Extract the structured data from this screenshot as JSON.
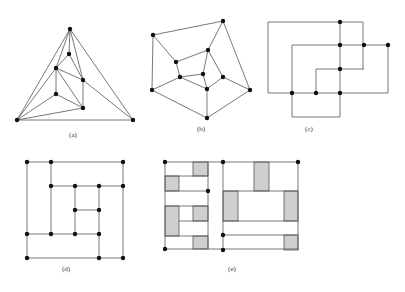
{
  "figure": {
    "panels": [
      {
        "id": "a",
        "label": "(a)",
        "label_pos": [
          73,
          137
        ],
        "nodes": [
          [
            70,
            29
          ],
          [
            69,
            54
          ],
          [
            56,
            68
          ],
          [
            83,
            80
          ],
          [
            56,
            94
          ],
          [
            83,
            108
          ],
          [
            17,
            120
          ],
          [
            133,
            120
          ]
        ],
        "edges": [
          [
            0,
            1
          ],
          [
            0,
            2
          ],
          [
            0,
            3
          ],
          [
            0,
            6
          ],
          [
            0,
            7
          ],
          [
            1,
            2
          ],
          [
            1,
            3
          ],
          [
            2,
            3
          ],
          [
            2,
            4
          ],
          [
            2,
            5
          ],
          [
            2,
            6
          ],
          [
            3,
            5
          ],
          [
            3,
            7
          ],
          [
            4,
            5
          ],
          [
            4,
            6
          ],
          [
            5,
            6
          ],
          [
            6,
            7
          ]
        ]
      },
      {
        "id": "b",
        "label": "(b)",
        "label_pos": [
          201,
          131
        ],
        "nodes": [
          [
            153,
            35
          ],
          [
            223,
            21
          ],
          [
            176,
            62
          ],
          [
            208,
            50
          ],
          [
            180,
            77
          ],
          [
            203,
            74
          ],
          [
            223,
            77
          ],
          [
            207,
            89
          ],
          [
            152,
            90
          ],
          [
            250,
            90
          ],
          [
            207,
            118
          ]
        ],
        "edges": [
          [
            0,
            1
          ],
          [
            0,
            2
          ],
          [
            0,
            8
          ],
          [
            1,
            3
          ],
          [
            1,
            9
          ],
          [
            2,
            3
          ],
          [
            2,
            4
          ],
          [
            3,
            5
          ],
          [
            3,
            6
          ],
          [
            4,
            5
          ],
          [
            4,
            8
          ],
          [
            4,
            7
          ],
          [
            5,
            7
          ],
          [
            6,
            7
          ],
          [
            6,
            9
          ],
          [
            7,
            10
          ],
          [
            8,
            10
          ],
          [
            9,
            10
          ]
        ]
      },
      {
        "id": "c",
        "label": "(c)",
        "label_pos": [
          309,
          131
        ],
        "nodes": [
          [
            340,
            22
          ],
          [
            340,
            45
          ],
          [
            364,
            45
          ],
          [
            388,
            45
          ],
          [
            340,
            69
          ],
          [
            292,
            93
          ],
          [
            316,
            93
          ],
          [
            340,
            93
          ]
        ],
        "segments": [
          [
            268,
            22,
            363,
            22
          ],
          [
            268,
            22,
            268,
            93
          ],
          [
            363,
            22,
            363,
            69
          ],
          [
            292,
            45,
            388,
            45
          ],
          [
            388,
            45,
            388,
            93
          ],
          [
            316,
            69,
            364,
            69
          ],
          [
            316,
            69,
            316,
            93
          ],
          [
            268,
            93,
            388,
            93
          ],
          [
            340,
            22,
            340,
            117
          ],
          [
            292,
            45,
            292,
            117
          ],
          [
            292,
            117,
            340,
            117
          ]
        ]
      },
      {
        "id": "d",
        "label": "(d)",
        "label_pos": [
          66,
          271
        ],
        "nodes": [
          [
            27,
            162
          ],
          [
            51,
            162
          ],
          [
            123,
            162
          ],
          [
            51,
            186
          ],
          [
            75,
            186
          ],
          [
            99,
            186
          ],
          [
            123,
            186
          ],
          [
            75,
            210
          ],
          [
            99,
            210
          ],
          [
            27,
            234
          ],
          [
            51,
            234
          ],
          [
            75,
            234
          ],
          [
            99,
            234
          ],
          [
            27,
            258
          ],
          [
            99,
            258
          ],
          [
            123,
            258
          ]
        ],
        "segments": [
          [
            27,
            162,
            123,
            162
          ],
          [
            27,
            162,
            27,
            258
          ],
          [
            123,
            162,
            123,
            258
          ],
          [
            27,
            258,
            123,
            258
          ],
          [
            51,
            162,
            51,
            234
          ],
          [
            51,
            186,
            123,
            186
          ],
          [
            75,
            186,
            75,
            234
          ],
          [
            75,
            210,
            99,
            210
          ],
          [
            99,
            186,
            99,
            258
          ],
          [
            27,
            234,
            99,
            234
          ]
        ]
      },
      {
        "id": "e",
        "label": "(e)",
        "label_pos": [
          232,
          271
        ],
        "nodes": [
          [
            165,
            162
          ],
          [
            208,
            191
          ],
          [
            165,
            249
          ],
          [
            223,
            162
          ],
          [
            298,
            162
          ],
          [
            223,
            235
          ],
          [
            223,
            250
          ]
        ],
        "segments": [
          [
            165,
            162,
            298,
            162
          ],
          [
            165,
            249,
            298,
            249
          ],
          [
            165,
            162,
            165,
            249
          ],
          [
            208,
            162,
            208,
            249
          ],
          [
            223,
            162,
            223,
            250
          ],
          [
            298,
            162,
            298,
            250
          ],
          [
            165,
            176,
            208,
            176
          ],
          [
            165,
            191,
            208,
            191
          ],
          [
            165,
            206,
            208,
            206
          ],
          [
            179,
            221,
            208,
            221
          ],
          [
            165,
            236,
            208,
            236
          ],
          [
            223,
            191,
            298,
            191
          ],
          [
            223,
            221,
            298,
            221
          ],
          [
            223,
            235,
            298,
            235
          ]
        ],
        "boxes": [
          [
            193,
            162,
            15,
            14
          ],
          [
            165,
            176,
            14,
            15
          ],
          [
            165,
            206,
            14,
            30
          ],
          [
            193,
            206,
            15,
            15
          ],
          [
            193,
            236,
            15,
            13
          ],
          [
            254,
            162,
            15,
            29
          ],
          [
            223,
            191,
            15,
            30
          ],
          [
            284,
            191,
            14,
            30
          ],
          [
            284,
            235,
            14,
            15
          ]
        ]
      }
    ]
  }
}
